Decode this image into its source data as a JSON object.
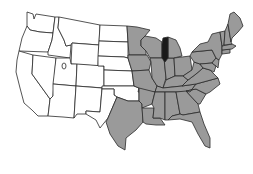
{
  "map": {
    "title": "Map of the contiguous United States",
    "colors": {
      "background": "#ffffff",
      "unshaded": "#ffffff",
      "shaded": "#9a9a9a",
      "highlight": "#1a1a1a",
      "border": "#2a2a2a"
    },
    "regions": {
      "unshaded": [
        "Washington",
        "Oregon",
        "California",
        "Idaho",
        "Nevada",
        "Montana",
        "Wyoming",
        "Utah",
        "Arizona",
        "Colorado",
        "New Mexico",
        "North Dakota",
        "South Dakota",
        "Nebraska",
        "Kansas",
        "Oklahoma",
        "West Texas"
      ],
      "shaded": [
        "Minnesota",
        "Iowa",
        "Missouri",
        "Arkansas",
        "Louisiana",
        "East Texas",
        "Wisconsin",
        "Illinois",
        "Michigan",
        "Indiana",
        "Ohio",
        "Kentucky",
        "Tennessee",
        "Mississippi",
        "Alabama",
        "Georgia",
        "Florida",
        "South Carolina",
        "North Carolina",
        "Virginia",
        "West Virginia",
        "Pennsylvania",
        "New York",
        "Maryland",
        "Delaware",
        "New Jersey",
        "Connecticut",
        "Rhode Island",
        "Massachusetts",
        "Vermont",
        "New Hampshire",
        "Maine"
      ],
      "highlighted": [
        "Lake Michigan / Western Michigan"
      ]
    }
  }
}
